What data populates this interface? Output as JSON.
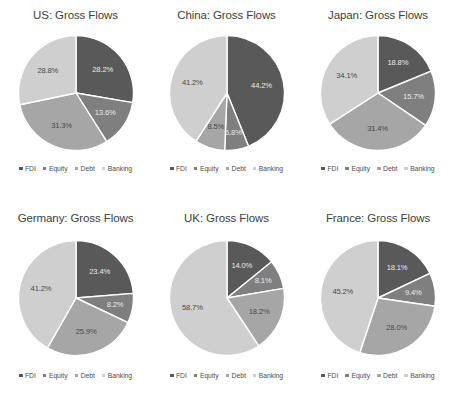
{
  "figure": {
    "series_labels": [
      "FDI",
      "Equity",
      "Debt",
      "Banking"
    ],
    "colors": [
      "#595959",
      "#7f7f7f",
      "#a6a6a6",
      "#cfcfcf"
    ],
    "background": "#ffffff",
    "label_suffix": "%"
  },
  "legend": {
    "items": [
      {
        "label": "FDI",
        "color": "#595959"
      },
      {
        "label": "Equity",
        "color": "#7f7f7f"
      },
      {
        "label": "Debt",
        "color": "#a6a6a6"
      },
      {
        "label": "Banking",
        "color": "#cfcfcf"
      }
    ]
  },
  "chart_data": [
    {
      "type": "pie",
      "title": "US: Gross Flows",
      "categories": [
        "FDI",
        "Equity",
        "Debt",
        "Banking"
      ],
      "values": [
        28.2,
        13.6,
        31.3,
        28.8
      ],
      "labels": [
        "28.2%",
        "13.6%",
        "31.3%",
        "28.8%"
      ],
      "colors": [
        "#595959",
        "#7f7f7f",
        "#a6a6a6",
        "#cfcfcf"
      ],
      "legend_position": "bottom",
      "start_angle": 0,
      "direction": "clockwise"
    },
    {
      "type": "pie",
      "title": "China: Gross Flows",
      "categories": [
        "FDI",
        "Equity",
        "Debt",
        "Banking"
      ],
      "values": [
        44.2,
        6.8,
        8.5,
        41.2
      ],
      "labels": [
        "44.2%",
        "6.8%",
        "8.5%",
        "41.2%"
      ],
      "colors": [
        "#595959",
        "#7f7f7f",
        "#a6a6a6",
        "#cfcfcf"
      ],
      "legend_position": "bottom",
      "start_angle": 0,
      "direction": "clockwise"
    },
    {
      "type": "pie",
      "title": "Japan: Gross Flows",
      "categories": [
        "FDI",
        "Equity",
        "Debt",
        "Banking"
      ],
      "values": [
        18.8,
        15.7,
        31.4,
        34.1
      ],
      "labels": [
        "18.8%",
        "15.7%",
        "31.4%",
        "34.1%"
      ],
      "colors": [
        "#595959",
        "#7f7f7f",
        "#a6a6a6",
        "#cfcfcf"
      ],
      "legend_position": "bottom",
      "start_angle": 0,
      "direction": "clockwise"
    },
    {
      "type": "pie",
      "title": "Germany: Gross Flows",
      "categories": [
        "FDI",
        "Equity",
        "Debt",
        "Banking"
      ],
      "values": [
        23.4,
        8.2,
        25.9,
        41.2
      ],
      "labels": [
        "23.4%",
        "8.2%",
        "25.9%",
        "41.2%"
      ],
      "colors": [
        "#595959",
        "#7f7f7f",
        "#a6a6a6",
        "#cfcfcf"
      ],
      "legend_position": "bottom",
      "start_angle": 0,
      "direction": "clockwise"
    },
    {
      "type": "pie",
      "title": "UK: Gross Flows",
      "categories": [
        "FDI",
        "Equity",
        "Debt",
        "Banking"
      ],
      "values": [
        14.0,
        8.1,
        18.2,
        58.7
      ],
      "labels": [
        "14.0%",
        "8.1%",
        "18.2%",
        "58.7%"
      ],
      "colors": [
        "#595959",
        "#7f7f7f",
        "#a6a6a6",
        "#cfcfcf"
      ],
      "legend_position": "bottom",
      "start_angle": 0,
      "direction": "clockwise"
    },
    {
      "type": "pie",
      "title": "France: Gross Flows",
      "categories": [
        "FDI",
        "Equity",
        "Debt",
        "Banking"
      ],
      "values": [
        18.1,
        9.4,
        28.0,
        45.2
      ],
      "labels": [
        "18.1%",
        "9.4%",
        "28.0%",
        "45.2%"
      ],
      "colors": [
        "#595959",
        "#7f7f7f",
        "#a6a6a6",
        "#cfcfcf"
      ],
      "legend_position": "bottom",
      "start_angle": 0,
      "direction": "clockwise"
    }
  ]
}
